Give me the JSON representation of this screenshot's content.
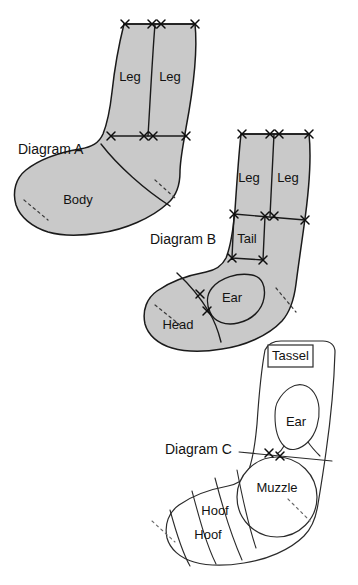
{
  "figure": {
    "background_color": "#ffffff",
    "fill_color_gray": "#c9c9c9",
    "fill_color_white": "#ffffff",
    "outline_color": "#1a1a1a"
  },
  "diagrams": [
    {
      "id": "a",
      "label": "Diagram A",
      "filled": "gray",
      "pieces": [
        {
          "name": "leg-left",
          "label": "Leg"
        },
        {
          "name": "leg-right",
          "label": "Leg"
        },
        {
          "name": "body",
          "label": "Body"
        }
      ]
    },
    {
      "id": "b",
      "label": "Diagram B",
      "filled": "gray",
      "pieces": [
        {
          "name": "leg-left",
          "label": "Leg"
        },
        {
          "name": "leg-right",
          "label": "Leg"
        },
        {
          "name": "tail",
          "label": "Tail"
        },
        {
          "name": "ear",
          "label": "Ear"
        },
        {
          "name": "head",
          "label": "Head"
        }
      ]
    },
    {
      "id": "c",
      "label": "Diagram C",
      "filled": "white",
      "pieces": [
        {
          "name": "tassel",
          "label": "Tassel"
        },
        {
          "name": "ear",
          "label": "Ear"
        },
        {
          "name": "muzzle",
          "label": "Muzzle"
        },
        {
          "name": "hoof-upper",
          "label": "Hoof"
        },
        {
          "name": "hoof-lower",
          "label": "Hoof"
        }
      ]
    }
  ],
  "labels": {
    "diagram_a": "Diagram A",
    "diagram_b": "Diagram B",
    "diagram_c": "Diagram C",
    "leg_a_left": "Leg",
    "leg_a_right": "Leg",
    "body": "Body",
    "leg_b_left": "Leg",
    "leg_b_right": "Leg",
    "tail": "Tail",
    "ear_b": "Ear",
    "head": "Head",
    "tassel": "Tassel",
    "ear_c": "Ear",
    "muzzle": "Muzzle",
    "hoof_upper": "Hoof",
    "hoof_lower": "Hoof"
  }
}
